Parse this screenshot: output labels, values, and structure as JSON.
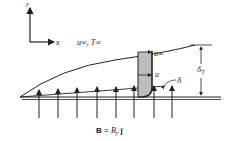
{
  "diagram": {
    "axes": {
      "x_label": "x",
      "y_label": "y"
    },
    "freestream_label": "u∞, T∞",
    "velocity_labels": {
      "outer": "u∞",
      "inner": "u"
    },
    "boundary_layer_label": "δ",
    "thermal_layer_label": "δT",
    "thermal_layer_sub": "T",
    "field_label": "B = B",
    "field_label_sub": "y",
    "field_label_vec": " ĵ",
    "arrow_count": 8,
    "colors": {
      "line": "#222222",
      "profile_fill": "#bdbdbd",
      "background": "#ffffff"
    }
  }
}
